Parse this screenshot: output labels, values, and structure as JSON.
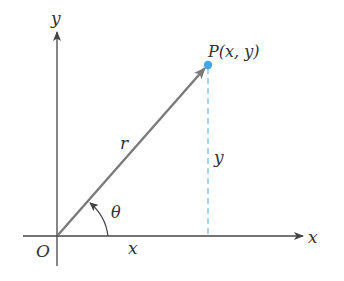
{
  "diagram": {
    "colors": {
      "axis": "#444444",
      "vector": "#7a7a7a",
      "point": "#3fa9e8",
      "dashed": "#6cc0ec",
      "text": "#333333"
    },
    "labels": {
      "y_axis": "y",
      "x_axis": "x",
      "origin": "O",
      "point": "P(x, y)",
      "radius": "r",
      "vertical": "y",
      "horizontal": "x",
      "angle": "θ"
    },
    "geometry": {
      "origin": [
        57,
        235
      ],
      "point_P": [
        208,
        65
      ],
      "x_axis_range": [
        23,
        303
      ],
      "y_axis_range": [
        265,
        32
      ],
      "arc_radius": 51
    }
  }
}
